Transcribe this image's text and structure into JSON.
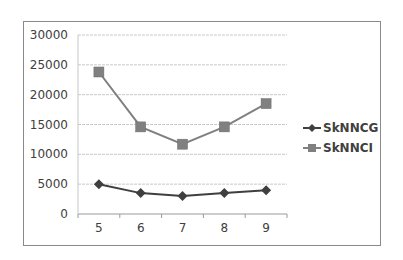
{
  "chart_data": {
    "type": "line",
    "title": "",
    "xlabel": "",
    "ylabel": "",
    "x": [
      5,
      6,
      7,
      8,
      9
    ],
    "categories": [
      "5",
      "6",
      "7",
      "8",
      "9"
    ],
    "ylim": [
      0,
      30000
    ],
    "yticks": [
      0,
      5000,
      10000,
      15000,
      20000,
      25000,
      30000
    ],
    "ytick_labels": [
      "0",
      "5000",
      "10000",
      "15000",
      "20000",
      "25000",
      "30000"
    ],
    "grid": true,
    "legend_position": "right",
    "series": [
      {
        "name": "SkNNCG",
        "marker": "diamond",
        "color": "#3f3f3f",
        "values": [
          5000,
          3500,
          3000,
          3500,
          4000
        ]
      },
      {
        "name": "SkNNCI",
        "marker": "square",
        "color": "#808080",
        "values": [
          23800,
          14600,
          11700,
          14600,
          18500
        ]
      }
    ]
  },
  "legend": {
    "items": [
      {
        "label": "SkNNCG"
      },
      {
        "label": "SkNNCI"
      }
    ]
  }
}
